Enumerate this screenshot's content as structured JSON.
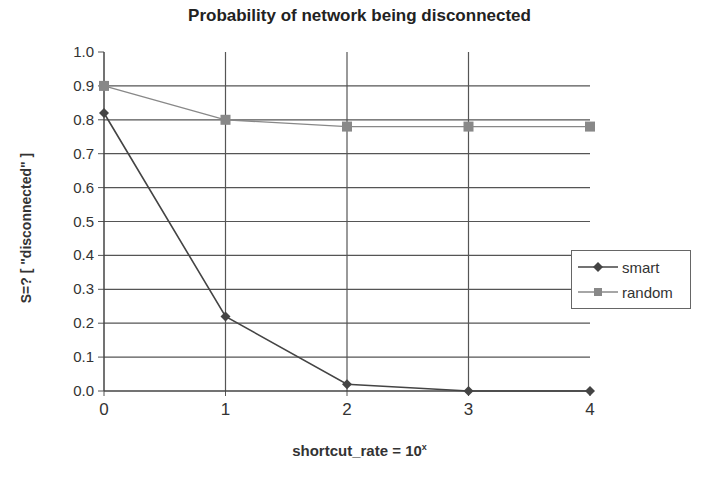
{
  "chart_data": {
    "type": "line",
    "title": "Probability of network being disconnected",
    "xlabel": "shortcut_rate = 10",
    "xlabel_superscript": "x",
    "ylabel": "S=? [ \"disconnected\" ]",
    "x": [
      0,
      1,
      2,
      3,
      4
    ],
    "xticks": [
      "0",
      "1",
      "2",
      "3",
      "4"
    ],
    "yticks": [
      "0.0",
      "0.1",
      "0.2",
      "0.3",
      "0.4",
      "0.5",
      "0.6",
      "0.7",
      "0.8",
      "0.9",
      "1.0"
    ],
    "ylim": [
      0,
      1.0
    ],
    "grid": true,
    "legend_position": "right",
    "series": [
      {
        "name": "smart",
        "marker": "diamond",
        "color": "#444444",
        "values": [
          0.82,
          0.22,
          0.02,
          0.0,
          0.0
        ]
      },
      {
        "name": "random",
        "marker": "square",
        "color": "#888888",
        "values": [
          0.9,
          0.8,
          0.78,
          0.78,
          0.78
        ]
      }
    ]
  },
  "legend": {
    "items": [
      {
        "label": "smart"
      },
      {
        "label": "random"
      }
    ]
  }
}
